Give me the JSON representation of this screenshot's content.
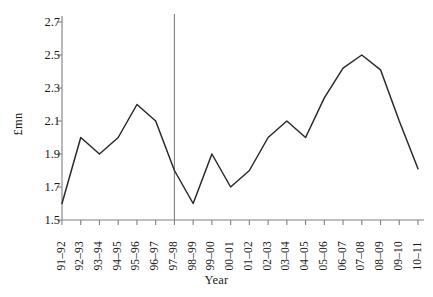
{
  "chart_data": {
    "type": "line",
    "title": "",
    "xlabel": "Year",
    "ylabel": "£mn",
    "categories": [
      "91–92",
      "92–93",
      "93–94",
      "94–95",
      "95–96",
      "96–97",
      "97–98",
      "98–99",
      "99–00",
      "00–01",
      "01–02",
      "02–03",
      "03–04",
      "04–05",
      "05–06",
      "06–07",
      "07–08",
      "08–09",
      "09–10",
      "10–11"
    ],
    "values": [
      1.6,
      2.0,
      1.9,
      2.0,
      2.2,
      2.1,
      1.8,
      1.6,
      1.9,
      1.7,
      1.8,
      2.0,
      2.1,
      2.0,
      2.24,
      2.42,
      2.5,
      2.41,
      2.1,
      1.81
    ],
    "ylim": [
      1.5,
      2.7
    ],
    "yticks": [
      1.5,
      1.7,
      1.9,
      2.1,
      2.3,
      2.5,
      2.7
    ],
    "ytick_labels": [
      "1.5",
      "1.7",
      "1.9",
      "2.1",
      "2.3",
      "2.5",
      "2.7"
    ],
    "grid": false,
    "legend": null,
    "series_color": "#2b2b2b",
    "axis_color": "#808080",
    "annotations": [
      {
        "kind": "vertical-reference-line",
        "at_category": "97–98",
        "color": "#808080",
        "extends_above_axis": true
      }
    ]
  }
}
